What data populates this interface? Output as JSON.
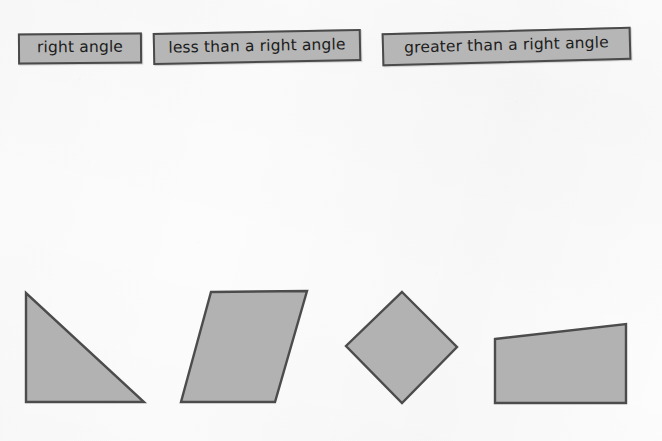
{
  "page": {
    "background_color": "#fcfcfc"
  },
  "labels": {
    "fill_color": "#b6b6b6",
    "border_color": "#4a4a4a",
    "text_color": "#1c1c1c",
    "items": [
      {
        "id": "right-angle",
        "text": "right angle"
      },
      {
        "id": "less-than",
        "text": "less than a right angle"
      },
      {
        "id": "greater-than",
        "text": "greater than a right angle"
      }
    ]
  },
  "shapes": {
    "fill_color": "#b2b2b2",
    "stroke_color": "#4c4c4c",
    "items": [
      {
        "id": "right-triangle",
        "name": "right triangle",
        "points": "26,293 26,402 144,402"
      },
      {
        "id": "parallelogram",
        "name": "parallelogram",
        "points": "211,292 307,291 275,402 181,402"
      },
      {
        "id": "rhombus",
        "name": "rhombus diamond",
        "points": "402,292 457,347 402,403 346,346"
      },
      {
        "id": "right-trapezoid",
        "name": "right trapezoid",
        "points": "495,339 626,324 626,403 495,403"
      }
    ]
  }
}
